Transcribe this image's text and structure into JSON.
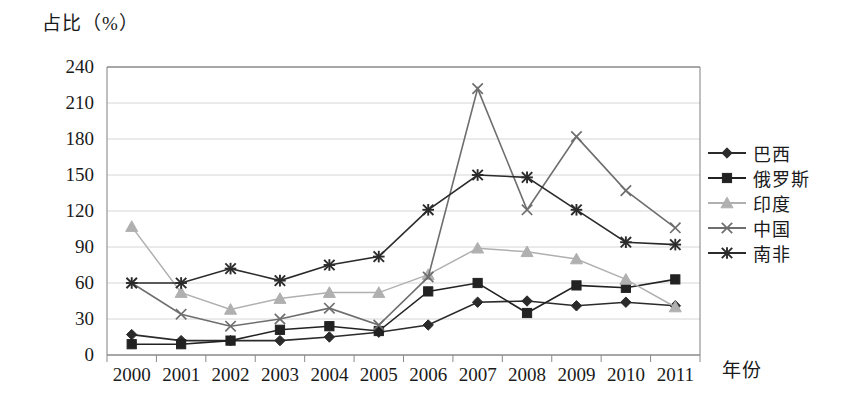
{
  "chart_data": {
    "type": "line",
    "title": "",
    "ylabel": "占比（%）",
    "xlabel": "年份",
    "grid": true,
    "legend_position": "right",
    "ylim": [
      0,
      240
    ],
    "yticks": [
      0,
      30,
      60,
      90,
      120,
      150,
      180,
      210,
      240
    ],
    "categories": [
      "2000",
      "2001",
      "2002",
      "2003",
      "2004",
      "2005",
      "2006",
      "2007",
      "2008",
      "2009",
      "2010",
      "2011"
    ],
    "series": [
      {
        "name": "巴西",
        "marker": "diamond",
        "color": "#2b2b2b",
        "values": [
          17,
          12,
          12,
          12,
          15,
          19,
          25,
          44,
          45,
          41,
          44,
          41
        ]
      },
      {
        "name": "俄罗斯",
        "marker": "square",
        "color": "#222222",
        "values": [
          9,
          9,
          12,
          21,
          24,
          20,
          53,
          60,
          35,
          58,
          56,
          63
        ]
      },
      {
        "name": "印度",
        "marker": "triangle",
        "color": "#b0b0b0",
        "values": [
          107,
          52,
          38,
          47,
          52,
          52,
          67,
          89,
          86,
          80,
          63,
          40
        ]
      },
      {
        "name": "中国",
        "marker": "x",
        "color": "#6e6e6e",
        "values": [
          60,
          34,
          24,
          30,
          39,
          25,
          65,
          222,
          121,
          182,
          137,
          106
        ]
      },
      {
        "name": "南非",
        "marker": "star",
        "color": "#2b2b2b",
        "values": [
          60,
          60,
          72,
          62,
          75,
          82,
          121,
          150,
          148,
          121,
          94,
          92
        ]
      }
    ]
  },
  "axes": {
    "y_axis_title": "占比（%）",
    "x_axis_title": "年份"
  }
}
